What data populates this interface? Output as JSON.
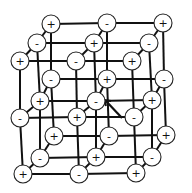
{
  "diagram": {
    "title": "",
    "type": "ionic crystal lattice (rock-salt, 3x3x3)",
    "colors": {
      "line": "#111111",
      "ion_fill": "#ffffff",
      "ion_stroke": "#222222"
    },
    "ion_radius": 9,
    "layers": [
      {
        "name": "back",
        "rows": [
          [
            {
              "x": 51,
              "y": 24,
              "charge": "+"
            },
            {
              "x": 107,
              "y": 23,
              "charge": "-"
            },
            {
              "x": 163,
              "y": 23,
              "charge": "+"
            }
          ],
          [
            {
              "x": 51,
              "y": 79,
              "charge": "-"
            },
            {
              "x": 107,
              "y": 79,
              "charge": "+"
            },
            {
              "x": 164,
              "y": 79,
              "charge": "-"
            }
          ],
          [
            {
              "x": 54,
              "y": 136,
              "charge": "+"
            },
            {
              "x": 109,
              "y": 136,
              "charge": "-"
            },
            {
              "x": 166,
              "y": 135,
              "charge": "+"
            }
          ]
        ]
      },
      {
        "name": "middle",
        "rows": [
          [
            {
              "x": 37,
              "y": 43,
              "charge": "-"
            },
            {
              "x": 94,
              "y": 43,
              "charge": "+"
            },
            {
              "x": 149,
              "y": 43,
              "charge": "-"
            }
          ],
          [
            {
              "x": 40,
              "y": 101,
              "charge": "+"
            },
            {
              "x": 96,
              "y": 101,
              "charge": "-"
            },
            {
              "x": 152,
              "y": 100,
              "charge": "+"
            }
          ],
          [
            {
              "x": 40,
              "y": 158,
              "charge": "-"
            },
            {
              "x": 96,
              "y": 157,
              "charge": "+"
            },
            {
              "x": 152,
              "y": 157,
              "charge": "-"
            }
          ]
        ]
      },
      {
        "name": "front",
        "rows": [
          [
            {
              "x": 20,
              "y": 61,
              "charge": "+"
            },
            {
              "x": 76,
              "y": 61,
              "charge": "-"
            },
            {
              "x": 132,
              "y": 61,
              "charge": "+"
            }
          ],
          [
            {
              "x": 20,
              "y": 118,
              "charge": "-"
            },
            {
              "x": 77,
              "y": 117,
              "charge": "+"
            },
            {
              "x": 134,
              "y": 117,
              "charge": "-"
            }
          ],
          [
            {
              "x": 23,
              "y": 174,
              "charge": "+"
            },
            {
              "x": 79,
              "y": 174,
              "charge": "-"
            },
            {
              "x": 136,
              "y": 173,
              "charge": "+"
            }
          ]
        ]
      }
    ],
    "arrow": {
      "from": [
        122,
        118
      ],
      "to": [
        105,
        100
      ],
      "target": "center ion (-)"
    }
  }
}
